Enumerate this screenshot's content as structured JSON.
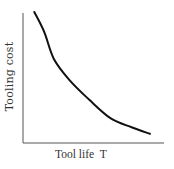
{
  "chart_data": {
    "type": "line",
    "title": "",
    "xlabel": "Tool life  T",
    "ylabel": "Tooling cost",
    "grid": false,
    "legend": null,
    "x_ticks": [],
    "y_ticks": [],
    "series": [
      {
        "name": "Tooling cost",
        "x": [
          0.08,
          0.15,
          0.22,
          0.33,
          0.47,
          0.62,
          0.77,
          0.9
        ],
        "y": [
          1.0,
          0.85,
          0.64,
          0.48,
          0.33,
          0.19,
          0.12,
          0.07
        ]
      }
    ],
    "xlim": [
      0,
      1
    ],
    "ylim": [
      0,
      1
    ]
  },
  "colors": {
    "axis": "#555555",
    "curve": "#111111",
    "text": "#333333",
    "background": "#ffffff"
  }
}
